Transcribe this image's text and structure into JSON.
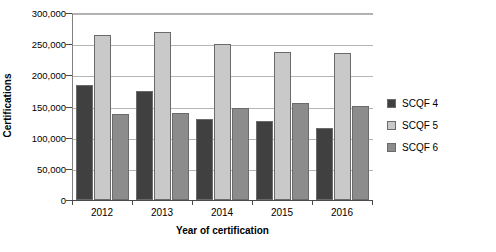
{
  "chart_data": {
    "type": "bar",
    "title": "",
    "xlabel": "Year of certification",
    "ylabel": "Certifications",
    "categories": [
      "2012",
      "2013",
      "2014",
      "2015",
      "2016"
    ],
    "series": [
      {
        "name": "SCQF 4",
        "color": "#404040",
        "values": [
          185000,
          175000,
          130000,
          126000,
          116000
        ]
      },
      {
        "name": "SCQF 5",
        "color": "#c9c9c9",
        "values": [
          265000,
          270000,
          250000,
          238000,
          236000
        ]
      },
      {
        "name": "SCQF 6",
        "color": "#8c8c8c",
        "values": [
          138000,
          139000,
          147000,
          155000,
          151000
        ]
      }
    ],
    "ylim": [
      0,
      300000
    ],
    "ytick_values": [
      0,
      50000,
      100000,
      150000,
      200000,
      250000,
      300000
    ],
    "ytick_labels": [
      "0",
      "50,000",
      "100,000",
      "150,000",
      "200,000",
      "250,000",
      "300,000"
    ],
    "grid": true,
    "legend_position": "right"
  },
  "legend": {
    "entries": [
      {
        "label": "SCQF 4",
        "color": "#404040"
      },
      {
        "label": "SCQF 5",
        "color": "#c9c9c9"
      },
      {
        "label": "SCQF 6",
        "color": "#8c8c8c"
      }
    ]
  },
  "axes": {
    "y_title": "Certifications",
    "x_title": "Year of certification"
  }
}
